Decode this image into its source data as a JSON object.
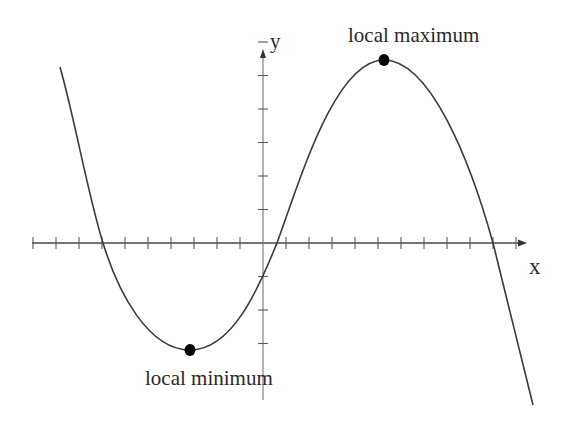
{
  "diagram": {
    "axes": {
      "x_label": "x",
      "y_label": "y",
      "x_ticks_left_of_origin": 10,
      "x_ticks_right_of_origin": 11,
      "y_ticks_above_origin": 6,
      "y_ticks_below_origin": 3
    },
    "annotations": {
      "local_max_label": "local maximum",
      "local_min_label": "local minimum"
    },
    "colors": {
      "curve": "#3a3a3a",
      "axis": "#4a4a4a",
      "point": "#000000",
      "background": "#ffffff"
    }
  },
  "chart_data": {
    "type": "line",
    "title": "",
    "xlabel": "x",
    "ylabel": "y",
    "x_tick_step_units": 1,
    "y_tick_step_units": 1,
    "roots_approx": [
      -7,
      0.6,
      10
    ],
    "y_intercept_approx": -1,
    "local_minimum_approx": {
      "x": -3.2,
      "y": -3.1
    },
    "local_maximum_approx": {
      "x": 5.3,
      "y": 5.4
    },
    "x": [
      -8.8,
      -7,
      -5.8,
      -4.5,
      -3.2,
      -1.9,
      -0.6,
      0.6,
      2.0,
      3.3,
      4.4,
      5.3,
      6.4,
      7.6,
      9.0,
      10.0,
      10.7,
      11.7
    ],
    "values": [
      5.1,
      0,
      -2.0,
      -2.9,
      -3.1,
      -2.8,
      -1.7,
      0,
      2.4,
      4.3,
      5.2,
      5.4,
      5.1,
      3.9,
      2.1,
      0,
      -1.7,
      -4.8
    ],
    "grid": false
  }
}
